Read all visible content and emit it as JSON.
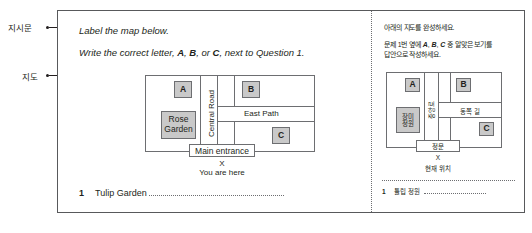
{
  "annotations": {
    "instructions_label": "지시문",
    "map_label": "지도"
  },
  "english_panel": {
    "instruction_line_1": "Label the map below.",
    "instruction_line_2_prefix": "Write the correct letter, ",
    "instruction_line_2_a": "A",
    "instruction_line_2_comma": ", ",
    "instruction_line_2_b": "B",
    "instruction_line_2_or": ", or ",
    "instruction_line_2_c": "C",
    "instruction_line_2_suffix": ", next to Question 1.",
    "map": {
      "box_a": "A",
      "box_b": "B",
      "box_c": "C",
      "rose_garden": "Rose\nGarden",
      "rose_garden_line1": "Rose",
      "rose_garden_line2": "Garden",
      "central_road": "Central Road",
      "east_path": "East Path",
      "main_entrance": "Main entrance",
      "marker_x": "X",
      "you_are_here": "You are here"
    },
    "question": {
      "number": "1",
      "text": "Tulip Garden"
    }
  },
  "korean_panel": {
    "instruction_line_1": "아래의 지도를 완성하세요.",
    "instruction_line_2_prefix": "문제 1번 옆에 ",
    "instruction_line_2_a": "A",
    "instruction_line_2_comma1": ", ",
    "instruction_line_2_b": "B",
    "instruction_line_2_comma2": ", ",
    "instruction_line_2_c": "C",
    "instruction_line_2_suffix": " 중 알맞은 보기를",
    "instruction_line_3": "답안으로 작성하세요.",
    "map": {
      "box_a": "A",
      "box_b": "B",
      "box_c": "C",
      "rose_garden_line1": "장미",
      "rose_garden_line2": "정원",
      "central_road": "중앙로",
      "east_path": "동쪽 길",
      "main_entrance": "정문",
      "marker_x": "X",
      "you_are_here": "현재 위치"
    },
    "question": {
      "number": "1",
      "text": "튤립 정원"
    }
  },
  "colors": {
    "frame_border": "#58595b",
    "map_border": "#6d6e71",
    "lot_fill": "#c9c9c9",
    "text": "#231f20",
    "page_background": "#ffffff"
  }
}
